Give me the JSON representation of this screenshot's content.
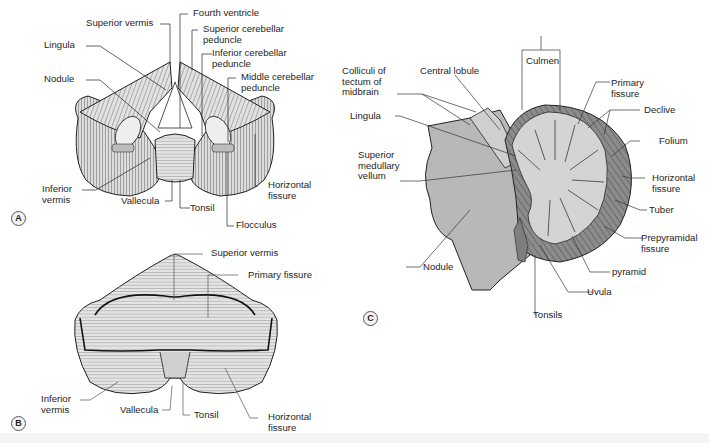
{
  "figure": {
    "panels": {
      "A": {
        "tag": "A",
        "view": "anterior view of cerebellum",
        "labels": {
          "superior_vermis": "Superior vermis",
          "fourth_ventricle": "Fourth ventricle",
          "superior_cerebellar_peduncle": "Superior cerebellar\npeduncle",
          "lingula": "Lingula",
          "inferior_cerebellar_peduncle": "Inferior cerebellar\npeduncle",
          "nodule": "Nodule",
          "middle_cerebellar_peduncle": "Middle cerebellar\npeduncle",
          "inferior_vermis": "Inferior\nvermis",
          "vallecula": "Vallecula",
          "tonsil": "Tonsil",
          "horizontal_fissure": "Horizontal\nfissure",
          "flocculus": "Flocculus"
        }
      },
      "B": {
        "tag": "B",
        "view": "superior/posterior view of cerebellum",
        "labels": {
          "superior_vermis": "Superior vermis",
          "primary_fissure": "Primary fissure",
          "inferior_vermis": "Inferior\nvermis",
          "vallecula": "Vallecula",
          "tonsil": "Tonsil",
          "horizontal_fissure": "Horizontal\nfissure"
        }
      },
      "C": {
        "tag": "C",
        "view": "midsagittal section of cerebellum",
        "labels": {
          "colliculi": "Colliculi of\ntectum of\nmidbrain",
          "central_lobule": "Central lobule",
          "culmen": "Culmen",
          "primary_fissure": "Primary\nfissure",
          "lingula": "Lingula",
          "declive": "Declive",
          "folium": "Folium",
          "superior_medullary_vellum": "Superior\nmedullary\nvellum",
          "horizontal_fissure": "Horizontal\nfissure",
          "tuber": "Tuber",
          "prepyramidal_fissure": "Prepyramidal\nfissure",
          "nodule": "Nodule",
          "pyramid": "pyramid",
          "uvula": "Uvula",
          "tonsils": "Tonsils"
        }
      }
    },
    "colors": {
      "line": "#222222",
      "folia_fill": "#d8d8d8",
      "brainstem_fill": "#b9b9b9",
      "white_matter": "#d4d4d4",
      "cortex_dark": "#8a8a8a",
      "background": "#ffffff"
    }
  }
}
